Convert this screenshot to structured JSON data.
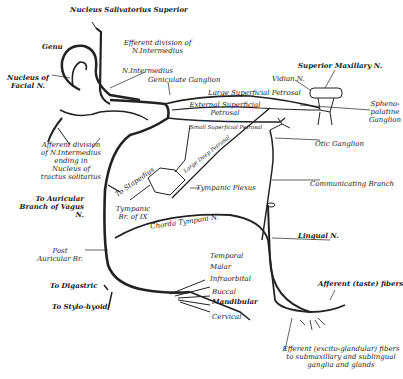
{
  "diagram": {
    "colors": {
      "ink": "#222222",
      "background": "#ffffff"
    },
    "labels": {
      "nucleus_salivatorius": "Nucleus Salivatorius Superior",
      "efferent_division": "Efferent division of N.Intermedius",
      "genu": "Genu",
      "nucleus_facial": "Nucleus of Facial N.",
      "n_intermedius": "N.Intermedius",
      "geniculate": "Geniculate Ganglion",
      "superior_maxillary": "Superior Maxillary N.",
      "vidian": "Vidian N.",
      "large_superficial_petrosal": "Large Superficial Petrosal",
      "external_superficial_petrosal": "External Superficial Petrosal",
      "spheno_palatine": "Spheno-palatine Ganglion",
      "small_superficial_petrosal": "Small Superficial Petrosal",
      "large_deep_petrosal": "Large Deep Petrosal",
      "otic_ganglion": "Otic Ganglion",
      "afferent_division": "Afferent division of N.Intermedius ending in Nucleus of tractus solitarius",
      "to_stapedius": "To Stapedius",
      "tympanic_plexus": "Tympanic Plexus",
      "communicating_branch": "Communicating Branch",
      "to_auricular": "To Auricular Branch of Vagus N.",
      "tympanic_br": "Tympanic Br. of IX",
      "chorda_tympani": "Chorda Tympani N.",
      "lingual": "Lingual N.",
      "post_auricular": "Post Auricular Br.",
      "temporal": "Temporal",
      "malar": "Malar",
      "infraorbital": "Infraorbital",
      "buccal": "Buccal",
      "mandibular": "Mandibular",
      "cervical": "Cervical",
      "to_digastric": "To Digastric",
      "to_stylohyoid": "To Stylo-hyoid",
      "afferent_taste": "Afferent (taste) fibers",
      "efferent_excito": "Efferent (excito-glandular) fibers to submaxillary and sublingual ganglia and glands"
    }
  }
}
